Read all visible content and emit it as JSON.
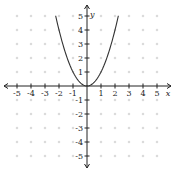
{
  "chart_data": {
    "type": "line",
    "title": "",
    "function": "y = x^2",
    "xlabel": "x",
    "ylabel": "y",
    "xlim": [
      -5,
      5
    ],
    "ylim": [
      -5,
      5
    ],
    "grid": "dots",
    "x_ticks": [
      -5,
      -4,
      -3,
      -2,
      -1,
      1,
      2,
      3,
      4,
      5
    ],
    "y_ticks": [
      -5,
      -4,
      -3,
      -2,
      -1,
      1,
      2,
      3,
      4,
      5
    ],
    "series": [
      {
        "name": "y = x^2",
        "x": [
          -2.24,
          -2,
          -1.5,
          -1,
          -0.5,
          0,
          0.5,
          1,
          1.5,
          2,
          2.24
        ],
        "y": [
          5,
          4,
          2.25,
          1,
          0.25,
          0,
          0.25,
          1,
          2.25,
          4,
          5
        ]
      }
    ],
    "colors": {
      "curve": "#333333",
      "axis": "#222222",
      "grid": "#bbbbbb"
    }
  }
}
